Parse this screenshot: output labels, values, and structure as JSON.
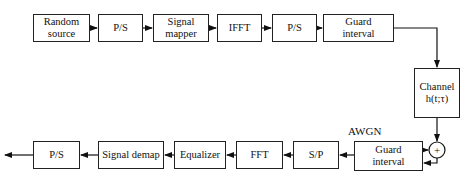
{
  "diagram": {
    "type": "block-diagram",
    "title": "",
    "transmitter": [
      {
        "id": "random_source",
        "label": "Random\nsource"
      },
      {
        "id": "ps1",
        "label": "P/S"
      },
      {
        "id": "signal_mapper",
        "label": "Signal\nmapper"
      },
      {
        "id": "ifft",
        "label": "IFFT"
      },
      {
        "id": "ps2",
        "label": "P/S"
      },
      {
        "id": "guard_tx",
        "label": "Guard\ninterval"
      }
    ],
    "channel": {
      "label": "Channel\nh(t;τ)"
    },
    "noise": {
      "label": "AWGN",
      "adder_symbol": "+"
    },
    "receiver": [
      {
        "id": "guard_rx",
        "label": "Guard\ninterval"
      },
      {
        "id": "sp",
        "label": "S/P"
      },
      {
        "id": "fft",
        "label": "FFT"
      },
      {
        "id": "equalizer",
        "label": "Equalizer"
      },
      {
        "id": "signal_demap",
        "label": "Signal demap"
      },
      {
        "id": "ps_out",
        "label": "P/S"
      }
    ],
    "edges": [
      [
        "random_source",
        "ps1"
      ],
      [
        "ps1",
        "signal_mapper"
      ],
      [
        "signal_mapper",
        "ifft"
      ],
      [
        "ifft",
        "ps2"
      ],
      [
        "ps2",
        "guard_tx"
      ],
      [
        "guard_tx",
        "channel"
      ],
      [
        "channel",
        "adder"
      ],
      [
        "AWGN",
        "adder"
      ],
      [
        "adder",
        "guard_rx"
      ],
      [
        "guard_rx",
        "sp"
      ],
      [
        "sp",
        "fft"
      ],
      [
        "fft",
        "equalizer"
      ],
      [
        "equalizer",
        "signal_demap"
      ],
      [
        "signal_demap",
        "ps_out"
      ],
      [
        "ps_out",
        "output"
      ]
    ]
  }
}
